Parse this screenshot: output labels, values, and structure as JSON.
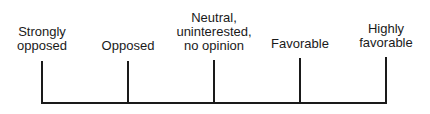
{
  "diagram": {
    "type": "attitude-scale",
    "points": [
      {
        "label": "Strongly\nopposed"
      },
      {
        "label": "Opposed"
      },
      {
        "label": "Neutral,\nuninterested,\nno opinion"
      },
      {
        "label": "Favorable"
      },
      {
        "label": "Highly\nfavorable"
      }
    ]
  }
}
